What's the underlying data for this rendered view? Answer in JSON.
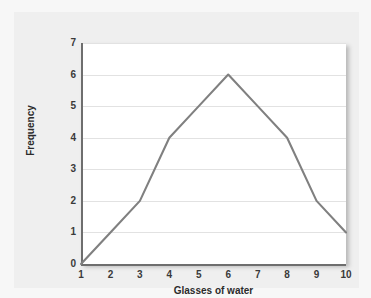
{
  "chart_data": {
    "type": "line",
    "title": "",
    "subtitle": "",
    "xlabel": "Glasses of water",
    "ylabel": "Frequency",
    "x": [
      1,
      2,
      3,
      4,
      5,
      6,
      7,
      8,
      9,
      10
    ],
    "values": [
      0,
      1,
      2,
      4,
      5,
      6,
      5,
      4,
      2,
      1
    ],
    "series": [
      {
        "name": "Frequency",
        "values": [
          0,
          1,
          2,
          4,
          5,
          6,
          5,
          4,
          2,
          1
        ]
      }
    ],
    "x_tick_labels": [
      "1",
      "2",
      "3",
      "4",
      "5",
      "6",
      "7",
      "8",
      "9",
      "10"
    ],
    "y_tick_labels": [
      "0",
      "1",
      "2",
      "3",
      "4",
      "5",
      "6",
      "7"
    ],
    "y_ticks": [
      0,
      1,
      2,
      3,
      4,
      5,
      6,
      7
    ],
    "xlim": [
      1,
      10
    ],
    "ylim": [
      0,
      7
    ],
    "grid": "horizontal",
    "legend": "none",
    "annotations": [],
    "colors": {
      "line": "#808080",
      "plot_background": "#ffffff",
      "figure_background": "#efefef",
      "canvas_background": "#f7f7f7",
      "gridline": "#e2e2e2",
      "axis_spine": "#6e6e6e",
      "tick_label": "#3a3a3a",
      "axis_title": "#2b2b2b"
    }
  }
}
